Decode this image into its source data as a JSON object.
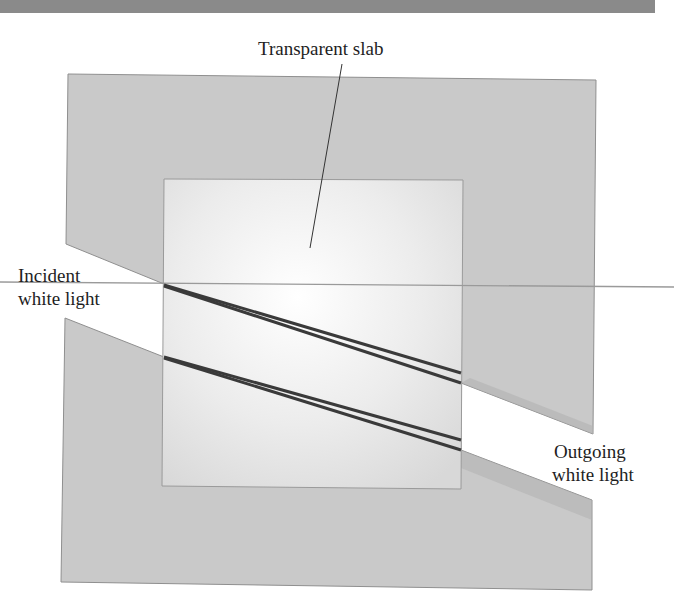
{
  "figure": {
    "type": "refraction-diagram",
    "labels": {
      "slab": "Transparent slab",
      "incident": [
        "Incident",
        "white light"
      ],
      "outgoing": [
        "Outgoing",
        "white light"
      ]
    },
    "colors": {
      "top_bar": "#8a8a8a",
      "outer_region": "#c9c9c9",
      "outer_edge": "#8f8f8f",
      "slab_center": "#ffffff",
      "slab_edge": "#d6d6d6",
      "slab_border": "#9a9a9a",
      "beam_lines": "#3a3a3a",
      "reference_line": "#9a9a9a"
    },
    "geometry": {
      "top_bar": {
        "x": 0,
        "y": 0,
        "w": 655,
        "h": 13
      },
      "outer_region_points": [
        [
          68,
          74
        ],
        [
          596,
          80
        ],
        [
          593,
          434
        ],
        [
          461,
          383
        ],
        [
          461,
          450
        ],
        [
          592,
          500
        ],
        [
          592,
          590
        ],
        [
          61,
          582
        ],
        [
          65,
          318
        ],
        [
          164,
          357
        ],
        [
          164,
          284
        ],
        [
          66,
          244
        ]
      ],
      "slab_rect": {
        "x": 164,
        "y": 179,
        "w": 298,
        "h": 308
      },
      "reference_line": {
        "x1": 0,
        "y1": 282,
        "x2": 674,
        "y2": 287
      },
      "leader_line": {
        "x1": 342,
        "y1": 64,
        "x2": 310,
        "y2": 248
      },
      "beams": [
        {
          "name": "upper-beam",
          "x1": 164,
          "y1": 285,
          "x2a": 461,
          "y2a": 373,
          "x2b": 461,
          "y2b": 383
        },
        {
          "name": "lower-beam",
          "x1": 164,
          "y1": 357,
          "x2a": 461,
          "y2a": 440,
          "x2b": 461,
          "y2b": 450
        }
      ]
    }
  }
}
